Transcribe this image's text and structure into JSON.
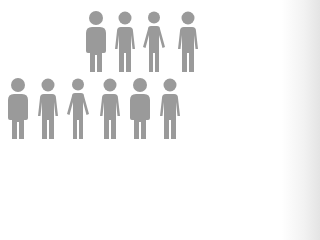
{
  "colors": {
    "figure": "#9a9a9a",
    "background": "#ffffff"
  },
  "rows": [
    {
      "name": "top-row",
      "figures": [
        {
          "type": "stocky",
          "cx": 96,
          "top": 11
        },
        {
          "type": "medium",
          "cx": 125,
          "top": 11
        },
        {
          "type": "thin",
          "cx": 154,
          "top": 11
        },
        {
          "type": "medium",
          "cx": 188,
          "top": 11
        }
      ]
    },
    {
      "name": "bottom-row",
      "figures": [
        {
          "type": "stocky",
          "cx": 18,
          "top": 78
        },
        {
          "type": "medium",
          "cx": 48,
          "top": 78
        },
        {
          "type": "thin",
          "cx": 78,
          "top": 78
        },
        {
          "type": "medium",
          "cx": 110,
          "top": 78
        },
        {
          "type": "stocky",
          "cx": 140,
          "top": 78
        },
        {
          "type": "medium",
          "cx": 170,
          "top": 78
        }
      ]
    }
  ]
}
